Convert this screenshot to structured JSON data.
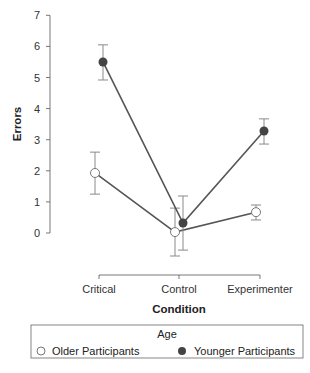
{
  "chart_data": {
    "type": "line",
    "title": "",
    "xlabel": "Condition",
    "ylabel": "Errors",
    "categories": [
      "Critical",
      "Control",
      "Experimenter"
    ],
    "ylim": [
      0,
      7
    ],
    "yticks": [
      0,
      1,
      2,
      3,
      4,
      5,
      6,
      7
    ],
    "grid": false,
    "legend_position": "bottom",
    "legend_title": "Age",
    "series": [
      {
        "name": "Older Participants",
        "marker": "open-circle",
        "values": [
          1.93,
          0.03,
          0.67
        ],
        "error_low": [
          1.25,
          -0.74,
          0.42
        ],
        "error_high": [
          2.6,
          0.8,
          0.9
        ]
      },
      {
        "name": "Younger Participants",
        "marker": "filled-circle",
        "values": [
          5.5,
          0.32,
          3.28
        ],
        "error_low": [
          4.92,
          -0.55,
          2.86
        ],
        "error_high": [
          6.05,
          1.19,
          3.67
        ]
      }
    ]
  },
  "colors": {
    "line": "#555555",
    "error_bar": "#8a8a8a",
    "filled_marker": "#444444",
    "open_marker_fill": "#ffffff",
    "axis": "#555555"
  }
}
